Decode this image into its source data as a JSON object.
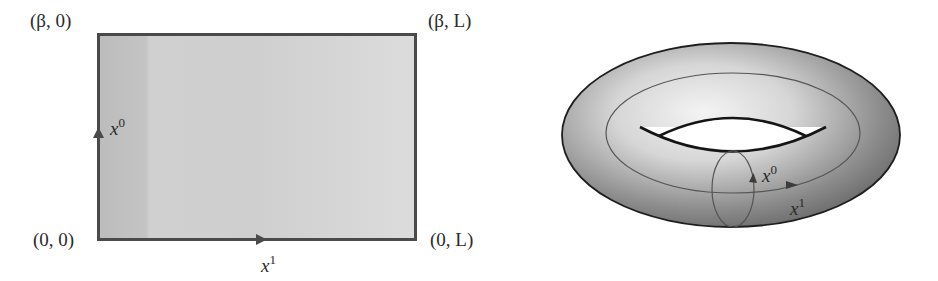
{
  "left_panel": {
    "title": "Rectangle with identified edges",
    "corners": {
      "top_left": "(β, 0)",
      "top_right": "(β, L)",
      "bottom_left": "(0, 0)",
      "bottom_right": "(0, L)"
    },
    "axes": {
      "vertical": {
        "base": "x",
        "sup": "0"
      },
      "horizontal": {
        "base": "x",
        "sup": "1"
      }
    }
  },
  "right_panel": {
    "title": "Torus",
    "cycles": {
      "small_cycle": {
        "base": "x",
        "sup": "0"
      },
      "large_cycle": {
        "base": "x",
        "sup": "1"
      }
    }
  },
  "colors": {
    "rect_edge": "#4a4a4a",
    "rect_fill_left": "#bdbdbd",
    "rect_fill_right": "#d9d9d9",
    "torus_outline": "#1e1e1e",
    "torus_light": "#f2f2f2",
    "torus_dark": "#5e5e5e",
    "cycle_line": "#555555"
  }
}
